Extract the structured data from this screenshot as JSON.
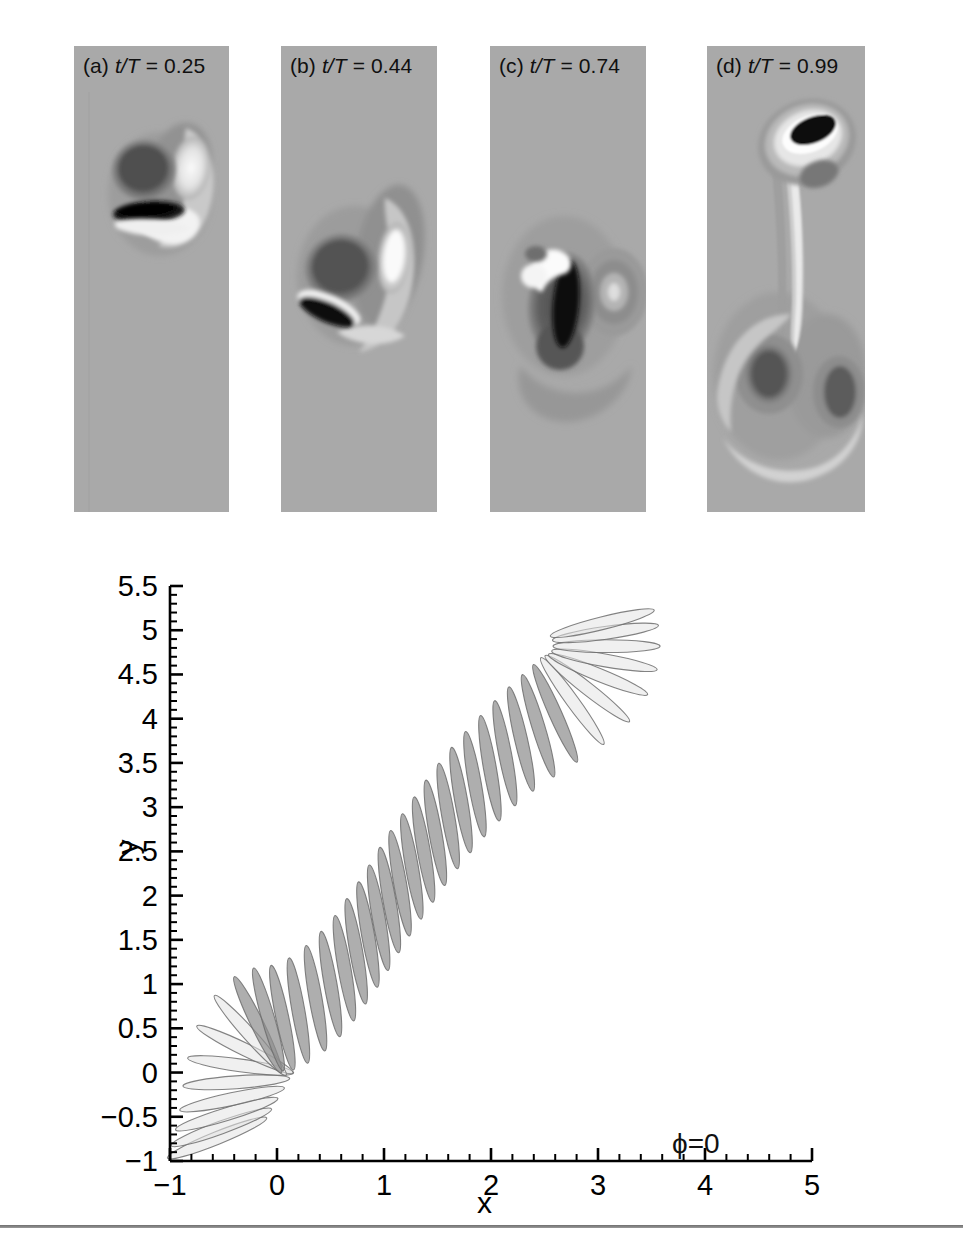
{
  "figure": {
    "panels": [
      {
        "id": "a",
        "prefix": "(a)",
        "quantity": "t/T",
        "equals": "=",
        "value": "0.25",
        "label": "(a) t/T = 0.25"
      },
      {
        "id": "b",
        "prefix": "(b)",
        "quantity": "t/T",
        "equals": "=",
        "value": "0.44",
        "label": "(b) t/T = 0.44"
      },
      {
        "id": "c",
        "prefix": "(c)",
        "quantity": "t/T",
        "equals": "=",
        "value": "0.74",
        "label": "(c) t/T = 0.74"
      },
      {
        "id": "d",
        "prefix": "(d)",
        "quantity": "t/T",
        "equals": "=",
        "value": "0.99",
        "label": "(d) t/T = 0.99"
      }
    ],
    "panel_background_color": "#a9a9a9",
    "annotation": {
      "phi": "ϕ=0"
    }
  },
  "chart_data": {
    "type": "scatter",
    "title": "",
    "subtitle": "",
    "xlabel": "x",
    "ylabel": "y",
    "xlim": [
      -1,
      5
    ],
    "ylim": [
      -1,
      5.5
    ],
    "xticks": [
      -1,
      0,
      1,
      2,
      3,
      4,
      5
    ],
    "xticklabels": [
      "−1",
      "0",
      "1",
      "2",
      "3",
      "4",
      "5"
    ],
    "yticks": [
      -1,
      -0.5,
      0,
      0.5,
      1,
      1.5,
      2,
      2.5,
      3,
      3.5,
      4,
      4.5,
      5,
      5.5
    ],
    "yticklabels": [
      "−1",
      "−0.5",
      "0",
      "0.5",
      "1",
      "1.5",
      "2",
      "2.5",
      "3",
      "3.5",
      "4",
      "4.5",
      "5",
      "5.5"
    ],
    "minor_ticks_per_interval": 5,
    "grid": false,
    "legend_position": "none",
    "annotations": [
      {
        "text": "ϕ=0",
        "x": 3.0,
        "y": 5.1
      }
    ],
    "series": [
      {
        "name": "wing chord sections",
        "description": "Successive wing cross-section ellipses along an inclined stroke plane; chord length 1, thickness ratio 0.12; angle of attack rotates through the stroke.",
        "chord": 1.0,
        "thickness_ratio": 0.12,
        "points": [
          {
            "x": -0.56,
            "y": -0.74,
            "angle_deg": 22
          },
          {
            "x": -0.52,
            "y": -0.62,
            "angle_deg": 20
          },
          {
            "x": -0.47,
            "y": -0.47,
            "angle_deg": 17
          },
          {
            "x": -0.42,
            "y": -0.3,
            "angle_deg": 12
          },
          {
            "x": -0.38,
            "y": -0.11,
            "angle_deg": 4
          },
          {
            "x": -0.34,
            "y": 0.08,
            "angle_deg": -8
          },
          {
            "x": -0.3,
            "y": 0.26,
            "angle_deg": -26
          },
          {
            "x": -0.25,
            "y": 0.42,
            "angle_deg": -48
          },
          {
            "x": -0.18,
            "y": 0.54,
            "angle_deg": -64
          },
          {
            "x": -0.08,
            "y": 0.6,
            "angle_deg": -74
          },
          {
            "x": 0.05,
            "y": 0.62,
            "angle_deg": -78
          },
          {
            "x": 0.2,
            "y": 0.7,
            "angle_deg": -80
          },
          {
            "x": 0.36,
            "y": 0.84,
            "angle_deg": -80
          },
          {
            "x": 0.5,
            "y": 1.0,
            "angle_deg": -80
          },
          {
            "x": 0.63,
            "y": 1.18,
            "angle_deg": -80
          },
          {
            "x": 0.74,
            "y": 1.37,
            "angle_deg": -80
          },
          {
            "x": 0.85,
            "y": 1.56,
            "angle_deg": -80
          },
          {
            "x": 0.95,
            "y": 1.75,
            "angle_deg": -80
          },
          {
            "x": 1.05,
            "y": 1.95,
            "angle_deg": -80
          },
          {
            "x": 1.15,
            "y": 2.14,
            "angle_deg": -80
          },
          {
            "x": 1.26,
            "y": 2.33,
            "angle_deg": -80
          },
          {
            "x": 1.37,
            "y": 2.52,
            "angle_deg": -80
          },
          {
            "x": 1.48,
            "y": 2.71,
            "angle_deg": -80
          },
          {
            "x": 1.6,
            "y": 2.9,
            "angle_deg": -80
          },
          {
            "x": 1.72,
            "y": 3.08,
            "angle_deg": -80
          },
          {
            "x": 1.85,
            "y": 3.26,
            "angle_deg": -80
          },
          {
            "x": 1.99,
            "y": 3.44,
            "angle_deg": -80
          },
          {
            "x": 2.13,
            "y": 3.61,
            "angle_deg": -79
          },
          {
            "x": 2.28,
            "y": 3.77,
            "angle_deg": -77
          },
          {
            "x": 2.44,
            "y": 3.92,
            "angle_deg": -73
          },
          {
            "x": 2.6,
            "y": 4.06,
            "angle_deg": -66
          },
          {
            "x": 2.76,
            "y": 4.2,
            "angle_deg": -54
          },
          {
            "x": 2.9,
            "y": 4.34,
            "angle_deg": -38
          },
          {
            "x": 3.0,
            "y": 4.5,
            "angle_deg": -22
          },
          {
            "x": 3.06,
            "y": 4.66,
            "angle_deg": -10
          },
          {
            "x": 3.08,
            "y": 4.82,
            "angle_deg": 0
          },
          {
            "x": 3.07,
            "y": 4.97,
            "angle_deg": 8
          },
          {
            "x": 3.04,
            "y": 5.08,
            "angle_deg": 14
          }
        ]
      }
    ]
  }
}
